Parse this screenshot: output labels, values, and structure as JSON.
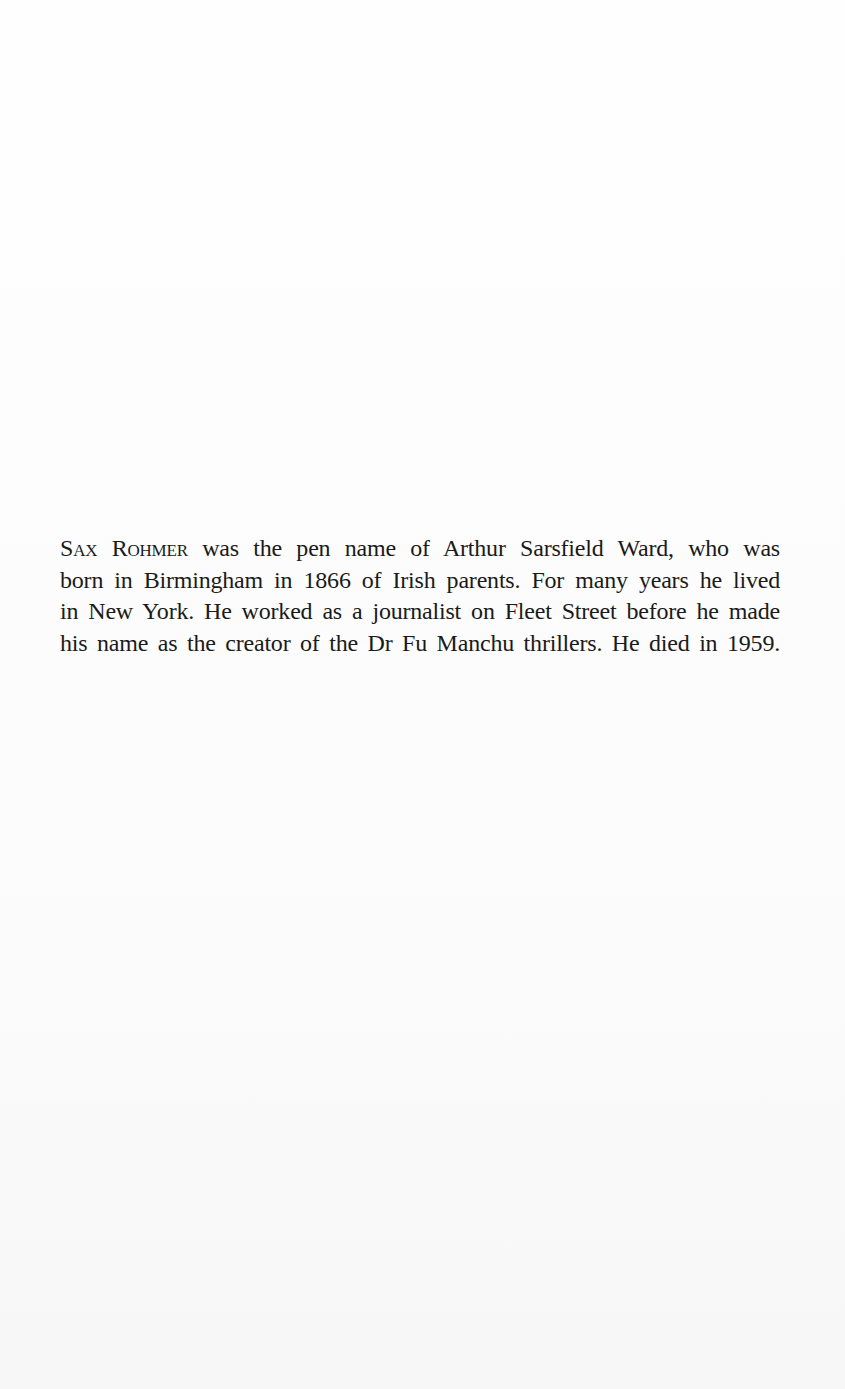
{
  "document": {
    "type": "book-page",
    "author_bio": {
      "author_name_smallcaps": "Sax Rohmer",
      "lines": [
        " was the pen name of Arthur Sarsfield Ward, who was",
        "born in Birmingham in 1866 of Irish parents. For many years he lived",
        "in New York. He worked as a journalist on Fleet Street before he made",
        "his name as the creator of the Dr Fu Manchu thrillers. He died in 1959."
      ],
      "full_text": "SAX ROHMER was the pen name of Arthur Sarsfield Ward, who was born in Birmingham in 1866 of Irish parents. For many years he lived in New York. He worked as a journalist on Fleet Street before he made his name as the creator of the Dr Fu Manchu thrillers. He died in 1959."
    },
    "colors": {
      "paper": "#fdfdfd",
      "ink": "#1a1a1a"
    }
  }
}
